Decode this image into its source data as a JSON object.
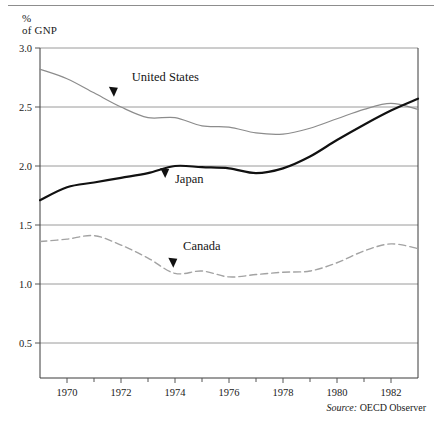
{
  "figure": {
    "y_axis_caption": "%\nof GNP",
    "source_label": "Source:",
    "source_text": "OECD Observer"
  },
  "chart_data": {
    "type": "line",
    "title": "",
    "xlabel": "",
    "ylabel": "% of GNP",
    "xlim": [
      1969,
      1983
    ],
    "ylim": [
      0.0,
      3.0
    ],
    "ytick_labels": [
      "3.0",
      "2.5",
      "2.0",
      "1.5",
      "1.0",
      "0.5"
    ],
    "yticks": [
      3.0,
      2.5,
      2.0,
      1.5,
      1.0,
      0.5
    ],
    "xtick_labels": [
      "1970",
      "1972",
      "1974",
      "1976",
      "1978",
      "1980",
      "1982"
    ],
    "xticks": [
      1970,
      1972,
      1974,
      1976,
      1978,
      1980,
      1982
    ],
    "minor_xticks": [
      1971,
      1973,
      1975,
      1977,
      1979,
      1981
    ],
    "grid": "horizontal",
    "legend_position": "inline-annotations",
    "x": [
      1969,
      1970,
      1971,
      1972,
      1973,
      1974,
      1975,
      1976,
      1977,
      1978,
      1979,
      1980,
      1981,
      1982,
      1983
    ],
    "series": [
      {
        "name": "United States",
        "style": "solid",
        "color": "#8c8c8c",
        "width": 1.2,
        "label_x": 1972.4,
        "label_y": 2.72,
        "arrow_x": 1971.7,
        "arrow_y": 2.63,
        "values": [
          2.82,
          2.74,
          2.62,
          2.5,
          2.41,
          2.41,
          2.34,
          2.33,
          2.28,
          2.27,
          2.32,
          2.4,
          2.48,
          2.53,
          2.48
        ]
      },
      {
        "name": "Japan",
        "style": "solid",
        "color": "#111111",
        "width": 2.2,
        "label_x": 1974.0,
        "label_y": 1.86,
        "arrow_x": 1973.6,
        "arrow_y": 1.94,
        "values": [
          1.71,
          1.82,
          1.86,
          1.9,
          1.94,
          2.0,
          1.99,
          1.98,
          1.94,
          1.98,
          2.08,
          2.22,
          2.35,
          2.47,
          2.57
        ]
      },
      {
        "name": "Canada",
        "style": "dashed",
        "color": "#a3a3a3",
        "width": 1.4,
        "label_x": 1974.3,
        "label_y": 1.29,
        "arrow_x": 1973.9,
        "arrow_y": 1.18,
        "values": [
          1.36,
          1.38,
          1.41,
          1.33,
          1.22,
          1.09,
          1.11,
          1.06,
          1.08,
          1.1,
          1.11,
          1.18,
          1.28,
          1.34,
          1.3
        ]
      }
    ]
  }
}
